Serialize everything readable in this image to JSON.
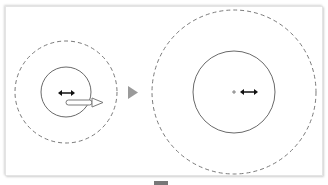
{
  "diagram": {
    "before": {
      "outer_ring": {
        "style": "dashed",
        "color": "#7a7a7a"
      },
      "inner_circle": {
        "style": "solid",
        "color": "#6a6a6a"
      },
      "cursor_icon": "horizontal-double-arrow",
      "drag_arrow": "right-arrow"
    },
    "transition_icon": "right-triangle",
    "after": {
      "outer_ring": {
        "style": "dashed",
        "color": "#7a7a7a"
      },
      "inner_circle": {
        "style": "solid",
        "color": "#6a6a6a"
      },
      "center_mark": "+",
      "cursor_icon": "horizontal-double-arrow"
    },
    "colors": {
      "arrow_gray": "#9a9a9a",
      "cursor_black": "#111111"
    }
  }
}
